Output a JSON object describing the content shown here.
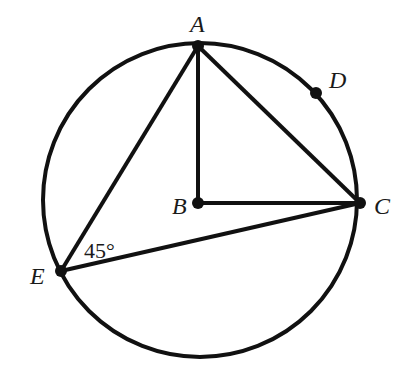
{
  "diagram": {
    "type": "circle-geometry",
    "stroke_color": "#111111",
    "background": "#ffffff",
    "circle": {
      "cx": 200,
      "cy": 200,
      "r": 157
    },
    "points": {
      "A": {
        "label": "A",
        "x": 198,
        "y": 46
      },
      "B": {
        "label": "B",
        "x": 198,
        "y": 203
      },
      "C": {
        "label": "C",
        "x": 360,
        "y": 203
      },
      "D": {
        "label": "D",
        "x": 316,
        "y": 93
      },
      "E": {
        "label": "E",
        "x": 61,
        "y": 271
      }
    },
    "segments": [
      [
        "A",
        "B"
      ],
      [
        "B",
        "C"
      ],
      [
        "A",
        "C"
      ],
      [
        "A",
        "E"
      ],
      [
        "E",
        "C"
      ]
    ],
    "angle_label": {
      "text": "45°",
      "at": "E"
    }
  }
}
